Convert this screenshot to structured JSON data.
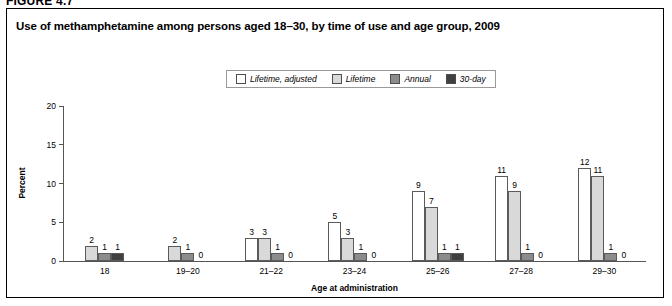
{
  "figure_number": "FIGURE 4.7",
  "title": "Use of methamphetamine among persons aged 18–30, by time of use and age group, 2009",
  "legend": {
    "items": [
      {
        "label": "Lifetime, adjusted",
        "color": "#ffffff"
      },
      {
        "label": "Lifetime",
        "color": "#d9d9d9"
      },
      {
        "label": "Annual",
        "color": "#8c8c8c"
      },
      {
        "label": "30-day",
        "color": "#404040"
      }
    ]
  },
  "chart_data": {
    "type": "bar",
    "title": "Use of methamphetamine among persons aged 18–30, by time of use and age group, 2009",
    "xlabel": "Age at administration",
    "ylabel": "Percent",
    "ylim": [
      0,
      20
    ],
    "yticks": [
      "0",
      "5",
      "10",
      "15",
      "20"
    ],
    "grid": false,
    "legend_position": "top-center",
    "categories": [
      "18",
      "19–20",
      "21–22",
      "23–24",
      "25–26",
      "27–28",
      "29–30"
    ],
    "series": [
      {
        "name": "Lifetime, adjusted",
        "color": "#ffffff",
        "values": [
          null,
          null,
          3,
          5,
          9,
          11,
          12
        ]
      },
      {
        "name": "Lifetime",
        "color": "#d9d9d9",
        "values": [
          2,
          2,
          3,
          3,
          7,
          9,
          11
        ]
      },
      {
        "name": "Annual",
        "color": "#8c8c8c",
        "values": [
          1,
          1,
          1,
          1,
          1,
          1,
          1
        ]
      },
      {
        "name": "30-day",
        "color": "#404040",
        "values": [
          1,
          0,
          0,
          0,
          1,
          0,
          0
        ]
      }
    ]
  }
}
